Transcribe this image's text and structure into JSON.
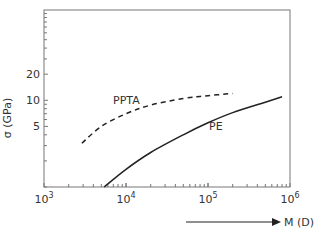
{
  "chart_data": {
    "type": "line",
    "title": "",
    "xlabel": "M (D)",
    "ylabel": "σ (GPa)",
    "xscale": "log",
    "yscale": "log",
    "xlim": [
      1000,
      1000000
    ],
    "ylim": [
      1,
      110
    ],
    "x_ticks": [
      {
        "value": 1000,
        "label_base": "10",
        "label_exp": "3"
      },
      {
        "value": 10000,
        "label_base": "10",
        "label_exp": "4"
      },
      {
        "value": 100000,
        "label_base": "10",
        "label_exp": "5"
      },
      {
        "value": 1000000,
        "label_base": "10",
        "label_exp": "6"
      }
    ],
    "y_ticks": [
      {
        "value": 5,
        "label": "5"
      },
      {
        "value": 10,
        "label": "10"
      },
      {
        "value": 20,
        "label": "20"
      }
    ],
    "grid": false,
    "legend": "inline labels",
    "series": [
      {
        "name": "PPTA",
        "style": "dashed",
        "x": [
          2900,
          5000,
          10000,
          20000,
          50000,
          100000,
          200000
        ],
        "y": [
          3.2,
          5.0,
          7.0,
          8.8,
          10.5,
          11.3,
          12.0
        ]
      },
      {
        "name": "PE",
        "style": "solid",
        "x": [
          5400,
          10000,
          20000,
          50000,
          100000,
          200000,
          500000,
          800000
        ],
        "y": [
          1.0,
          1.6,
          2.5,
          4.0,
          5.5,
          7.2,
          9.5,
          11.0
        ]
      }
    ]
  },
  "labels": {
    "y_axis_title": "σ (GPa)",
    "x_axis_title": "M (D)",
    "series_ppta": "PPTA",
    "series_pe": "PE"
  }
}
